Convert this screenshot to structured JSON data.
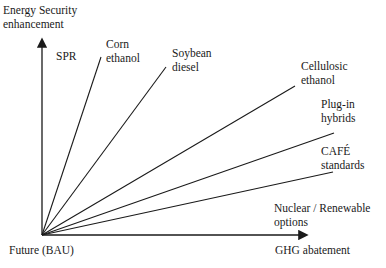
{
  "diagram": {
    "y_axis_label": [
      "Energy Security",
      "enhancement"
    ],
    "x_axis_label": "GHG abatement",
    "origin_label": "Future (BAU)",
    "options": [
      {
        "name": "SPR",
        "lines": [
          "SPR"
        ]
      },
      {
        "name": "Corn ethanol",
        "lines": [
          "Corn",
          "ethanol"
        ]
      },
      {
        "name": "Soybean diesel",
        "lines": [
          "Soybean",
          "diesel"
        ]
      },
      {
        "name": "Cellulosic ethanol",
        "lines": [
          "Cellulosic",
          "ethanol"
        ]
      },
      {
        "name": "Plug-in hybrids",
        "lines": [
          "Plug-in",
          "hybrids"
        ]
      },
      {
        "name": "CAFÉ standards",
        "lines": [
          "CAFÉ",
          "standards"
        ]
      },
      {
        "name": "Nuclear / Renewable options",
        "lines": [
          "Nuclear / Renewable",
          "options"
        ]
      }
    ],
    "line_color": "#1a1a1a"
  }
}
